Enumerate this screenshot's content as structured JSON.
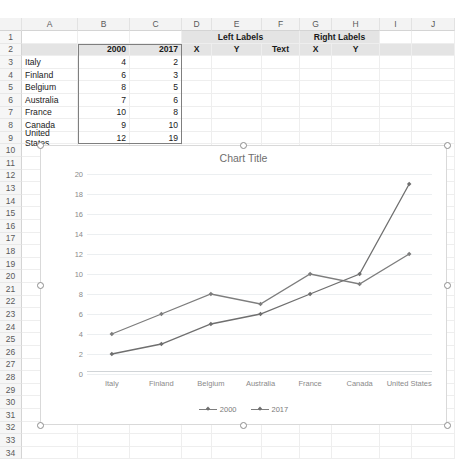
{
  "spreadsheet": {
    "column_headers": [
      "A",
      "B",
      "C",
      "D",
      "E",
      "F",
      "G",
      "H",
      "I",
      "J"
    ],
    "row_headers": [
      "1",
      "2",
      "3",
      "4",
      "5",
      "6",
      "7",
      "8",
      "9",
      "10",
      "11",
      "12",
      "13",
      "14",
      "15",
      "16",
      "17",
      "18",
      "19",
      "20",
      "21",
      "22",
      "23",
      "24",
      "25",
      "26",
      "27",
      "28",
      "29",
      "30",
      "31",
      "32",
      "33",
      "34"
    ],
    "header_row": {
      "col_b": "2000",
      "col_c": "2017",
      "left_labels": "Left Labels",
      "right_labels": "Right Labels",
      "left_x": "X",
      "left_y": "Y",
      "left_text": "Text",
      "right_x": "X",
      "right_y": "Y"
    },
    "rows": [
      {
        "row": "3",
        "country": "Italy",
        "v2000": "4",
        "v2017": "2"
      },
      {
        "row": "4",
        "country": "Finland",
        "v2000": "6",
        "v2017": "3"
      },
      {
        "row": "5",
        "country": "Belgium",
        "v2000": "8",
        "v2017": "5"
      },
      {
        "row": "6",
        "country": "Australia",
        "v2000": "7",
        "v2017": "6"
      },
      {
        "row": "7",
        "country": "France",
        "v2000": "10",
        "v2017": "8"
      },
      {
        "row": "8",
        "country": "Canada",
        "v2000": "9",
        "v2017": "10"
      },
      {
        "row": "9",
        "country": "United States",
        "v2000": "12",
        "v2017": "19"
      }
    ],
    "selection_range": "B2:C9"
  },
  "chart": {
    "title": "Chart Title",
    "selected": true,
    "legend": [
      "2000",
      "2017"
    ]
  },
  "chart_data": {
    "type": "line",
    "title": "Chart Title",
    "categories": [
      "Italy",
      "Finland",
      "Belgium",
      "Australia",
      "France",
      "Canada",
      "United States"
    ],
    "series": [
      {
        "name": "2000",
        "values": [
          4,
          6,
          8,
          7,
          10,
          9,
          12
        ],
        "color": "#7d7d7d"
      },
      {
        "name": "2017",
        "values": [
          2,
          3,
          5,
          6,
          8,
          10,
          19
        ],
        "color": "#6f6f6f"
      }
    ],
    "xlabel": "",
    "ylabel": "",
    "ylim": [
      0,
      20
    ],
    "ytick_step": 2,
    "yticks": [
      0,
      2,
      4,
      6,
      8,
      10,
      12,
      14,
      16,
      18,
      20
    ],
    "grid": true,
    "legend_position": "bottom",
    "markers": "diamond"
  }
}
